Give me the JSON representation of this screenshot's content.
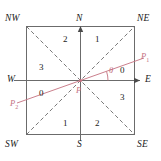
{
  "figure": {
    "colors": {
      "frame": "#6b6b6b",
      "axis": "#6b6b6b",
      "diagonal": "#6b6b6b",
      "ray": "#c4717f",
      "label": "#1a1a1a"
    }
  },
  "compass": {
    "nw": "NW",
    "n": "N",
    "ne": "NE",
    "w": "W",
    "e": "E",
    "sw": "SW",
    "s": "S",
    "se": "SE"
  },
  "octants": {
    "top_left": "2",
    "top_right": "1",
    "left_upper": "3",
    "left_lower": "0",
    "right_upper": "0",
    "right_lower": "3",
    "bottom_left": "1",
    "bottom_right": "2"
  },
  "points": {
    "center": "P",
    "p1": "P",
    "p1_sub": "1",
    "p2": "P",
    "p2_sub": "2"
  },
  "angle": {
    "theta": "θ"
  }
}
